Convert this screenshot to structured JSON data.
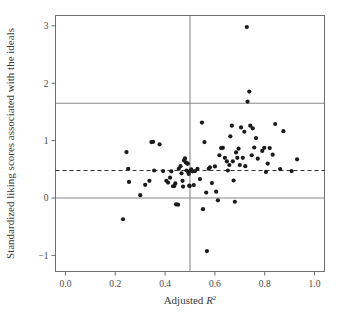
{
  "figure": {
    "background": "#ffffff",
    "point_color": "#1b1b1b",
    "frame_color": "#6e6e6e",
    "reference_line_color": "#8a8a8a",
    "dashed_line_color": "#2f2f2f"
  },
  "chart_data": {
    "type": "scatter",
    "title": "",
    "subtitle": "",
    "xlabel": "Adjusted R",
    "xlabel_exponent": "2",
    "ylabel": "Standardized liking scores associated with the ideals",
    "xlim": [
      -0.04,
      1.04
    ],
    "ylim": [
      -1.28,
      3.18
    ],
    "xticks": [
      0.0,
      0.2,
      0.4,
      0.6,
      0.8,
      1.0
    ],
    "xtick_labels": [
      "0.0",
      "0.2",
      "0.4",
      "0.6",
      "0.8",
      "1.0"
    ],
    "yticks": [
      -1,
      0,
      1,
      2,
      3
    ],
    "ytick_labels": [
      "−1",
      "0",
      "1",
      "2",
      "3"
    ],
    "grid": false,
    "legend": null,
    "annotations": [],
    "reference_lines": [
      {
        "name": "vertical-median-line",
        "orientation": "vertical",
        "value": 0.5,
        "style": "solid",
        "color": "#8a8a8a"
      },
      {
        "name": "horizontal-zero-line",
        "orientation": "horizontal",
        "value": 0.0,
        "style": "solid",
        "color": "#8a8a8a"
      },
      {
        "name": "horizontal-upper-line",
        "orientation": "horizontal",
        "value": 1.65,
        "style": "solid",
        "color": "#8a8a8a"
      },
      {
        "name": "horizontal-mean-line",
        "orientation": "horizontal",
        "value": 0.48,
        "style": "dashed",
        "color": "#2f2f2f"
      }
    ],
    "marker": {
      "shape": "circle",
      "size": 2.1,
      "color": "#1b1b1b"
    },
    "n_points": 88,
    "points": [
      [
        0.231,
        -0.37
      ],
      [
        0.245,
        0.8
      ],
      [
        0.252,
        0.51
      ],
      [
        0.255,
        0.28
      ],
      [
        0.3,
        0.05
      ],
      [
        0.32,
        0.23
      ],
      [
        0.337,
        0.3
      ],
      [
        0.345,
        0.975
      ],
      [
        0.352,
        0.98
      ],
      [
        0.356,
        0.48
      ],
      [
        0.378,
        0.935
      ],
      [
        0.392,
        0.47
      ],
      [
        0.405,
        0.3
      ],
      [
        0.412,
        0.27
      ],
      [
        0.42,
        0.355
      ],
      [
        0.425,
        0.465
      ],
      [
        0.432,
        0.205
      ],
      [
        0.437,
        0.21
      ],
      [
        0.441,
        0.255
      ],
      [
        0.444,
        -0.11
      ],
      [
        0.452,
        -0.115
      ],
      [
        0.455,
        0.51
      ],
      [
        0.462,
        0.555
      ],
      [
        0.466,
        0.43
      ],
      [
        0.47,
        0.3
      ],
      [
        0.472,
        0.2
      ],
      [
        0.476,
        0.655
      ],
      [
        0.48,
        0.69
      ],
      [
        0.483,
        0.62
      ],
      [
        0.486,
        0.48
      ],
      [
        0.489,
        0.6
      ],
      [
        0.491,
        0.6
      ],
      [
        0.493,
        0.455
      ],
      [
        0.495,
        0.42
      ],
      [
        0.497,
        0.215
      ],
      [
        0.499,
        0.21
      ],
      [
        0.502,
        0.48
      ],
      [
        0.505,
        0.5
      ],
      [
        0.51,
        0.465
      ],
      [
        0.515,
        0.225
      ],
      [
        0.52,
        0.47
      ],
      [
        0.53,
        0.51
      ],
      [
        0.54,
        0.33
      ],
      [
        0.548,
        1.315
      ],
      [
        0.552,
        -0.195
      ],
      [
        0.558,
        0.975
      ],
      [
        0.565,
        0.095
      ],
      [
        0.568,
        -0.925
      ],
      [
        0.575,
        0.51
      ],
      [
        0.58,
        0.535
      ],
      [
        0.588,
        0.26
      ],
      [
        0.6,
        0.55
      ],
      [
        0.605,
        0.11
      ],
      [
        0.612,
        -0.04
      ],
      [
        0.618,
        0.745
      ],
      [
        0.625,
        0.87
      ],
      [
        0.632,
        0.875
      ],
      [
        0.64,
        0.7
      ],
      [
        0.648,
        0.64
      ],
      [
        0.652,
        0.48
      ],
      [
        0.658,
        0.575
      ],
      [
        0.662,
        1.075
      ],
      [
        0.668,
        1.26
      ],
      [
        0.672,
        0.64
      ],
      [
        0.675,
        0.305
      ],
      [
        0.68,
        -0.065
      ],
      [
        0.685,
        0.795
      ],
      [
        0.69,
        0.7
      ],
      [
        0.695,
        0.86
      ],
      [
        0.7,
        0.575
      ],
      [
        0.705,
        1.23
      ],
      [
        0.712,
        0.7
      ],
      [
        0.718,
        1.155
      ],
      [
        0.722,
        0.555
      ],
      [
        0.728,
        2.98
      ],
      [
        0.731,
        1.68
      ],
      [
        0.738,
        1.855
      ],
      [
        0.742,
        1.26
      ],
      [
        0.748,
        0.745
      ],
      [
        0.752,
        1.215
      ],
      [
        0.758,
        0.88
      ],
      [
        0.765,
        1.045
      ],
      [
        0.772,
        0.685
      ],
      [
        0.79,
        0.82
      ],
      [
        0.798,
        0.875
      ],
      [
        0.805,
        0.455
      ],
      [
        0.812,
        0.6
      ],
      [
        0.82,
        0.87
      ],
      [
        0.832,
        0.755
      ],
      [
        0.842,
        1.29
      ],
      [
        0.862,
        0.505
      ],
      [
        0.875,
        1.165
      ],
      [
        0.908,
        0.47
      ],
      [
        0.93,
        0.675
      ]
    ]
  }
}
